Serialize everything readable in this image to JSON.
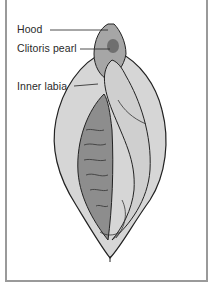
{
  "diagram": {
    "labels": [
      {
        "text": "Hood",
        "target": "hood"
      },
      {
        "text": "Clitoris pearl",
        "target": "clitoris-pearl"
      },
      {
        "text": "Inner labia",
        "target": "inner-labia"
      }
    ],
    "colors": {
      "border": "#9a9a9a",
      "outline": "#222222",
      "light_fill": "#d4d4d4",
      "mid_fill": "#a8a8a8",
      "dark_fill": "#7a7a7a",
      "line": "#333333"
    }
  }
}
